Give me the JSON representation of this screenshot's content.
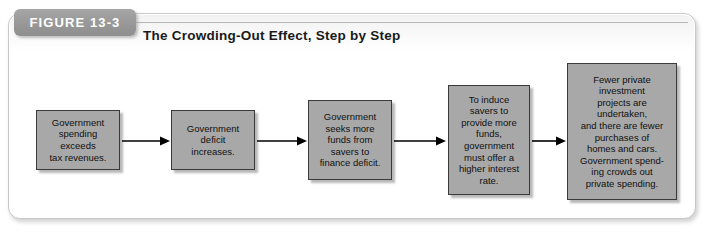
{
  "figure": {
    "tab_label": "FIGURE 13-3",
    "title": "The Crowding-Out Effect, Step by Step"
  },
  "colors": {
    "tab_background": "#9a9a9a",
    "tab_text": "#ffffff",
    "box_fill": "#a8a8a8",
    "box_border": "#3a3a3a",
    "box_text": "#101010",
    "arrow": "#000000",
    "frame_border": "#c9c9c9",
    "page_background": "#ffffff"
  },
  "diagram": {
    "type": "flowchart",
    "direction": "left-to-right",
    "step_count": 5,
    "arrow_count": 4,
    "steps": [
      {
        "index": 1,
        "text": "Government\nspending\nexceeds\ntax revenues."
      },
      {
        "index": 2,
        "text": "Government\ndeficit\nincreases."
      },
      {
        "index": 3,
        "text": "Government\nseeks more\nfunds from\nsavers to\nfinance deficit."
      },
      {
        "index": 4,
        "text": "To induce\nsavers to\nprovide more\nfunds,\ngovernment\nmust offer a\nhigher interest\nrate."
      },
      {
        "index": 5,
        "text": "Fewer private\ninvestment\nprojects are\nundertaken,\nand there are fewer\npurchases of\nhomes and cars.\nGovernment spend-\ning crowds out\nprivate spending."
      }
    ]
  }
}
